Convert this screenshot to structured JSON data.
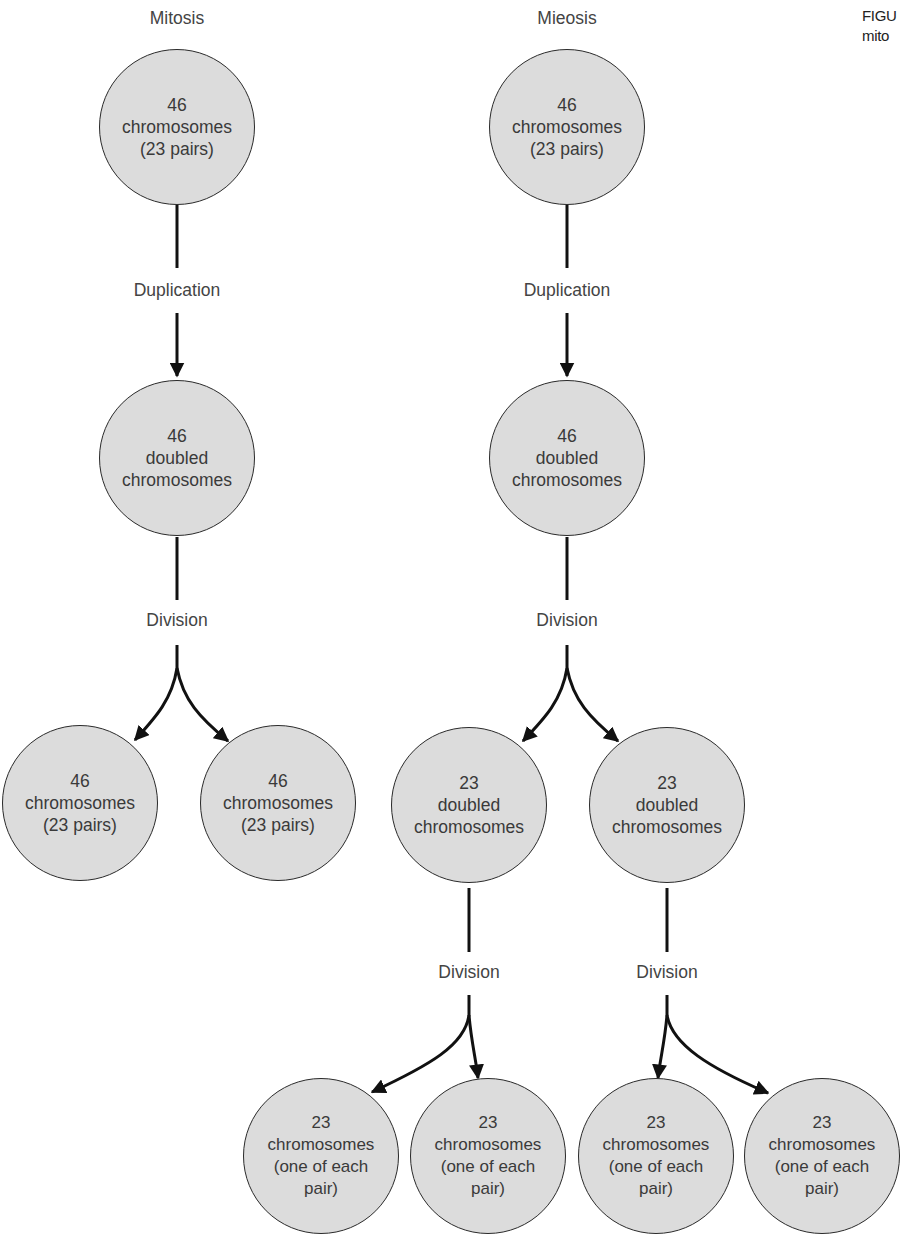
{
  "caption": {
    "line1": "FIGU",
    "line2": "mito"
  },
  "columns": {
    "mitosis": {
      "title": "Mitosis"
    },
    "meiosis": {
      "title": "Mieosis"
    }
  },
  "labels": {
    "duplication": "Duplication",
    "division": "Division"
  },
  "nodes": {
    "mit_top": {
      "l1": "46",
      "l2": "chromosomes",
      "l3": "(23 pairs)"
    },
    "mit_mid": {
      "l1": "46",
      "l2": "doubled",
      "l3": "chromosomes"
    },
    "mit_bot_a": {
      "l1": "46",
      "l2": "chromosomes",
      "l3": "(23 pairs)"
    },
    "mit_bot_b": {
      "l1": "46",
      "l2": "chromosomes",
      "l3": "(23 pairs)"
    },
    "mei_top": {
      "l1": "46",
      "l2": "chromosomes",
      "l3": "(23 pairs)"
    },
    "mei_mid": {
      "l1": "46",
      "l2": "doubled",
      "l3": "chromosomes"
    },
    "mei_l3_a": {
      "l1": "23",
      "l2": "doubled",
      "l3": "chromosomes"
    },
    "mei_l3_b": {
      "l1": "23",
      "l2": "doubled",
      "l3": "chromosomes"
    },
    "mei_l4_a": {
      "l1": "23",
      "l2": "chromosomes",
      "l3": "(one of each",
      "l4": "pair)"
    },
    "mei_l4_b": {
      "l1": "23",
      "l2": "chromosomes",
      "l3": "(one of each",
      "l4": "pair)"
    },
    "mei_l4_c": {
      "l1": "23",
      "l2": "chromosomes",
      "l3": "(one of each",
      "l4": "pair)"
    },
    "mei_l4_d": {
      "l1": "23",
      "l2": "chromosomes",
      "l3": "(one of each",
      "l4": "pair)"
    }
  },
  "colors": {
    "node_fill": "#dcdcdc",
    "stroke": "#1a1a1a",
    "text": "#3a3a3a"
  }
}
